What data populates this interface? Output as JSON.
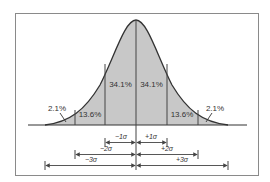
{
  "diagram": {
    "type": "normal-distribution",
    "colors": {
      "frame": "#8a8a8a",
      "fill": "#c8c8c8",
      "curve": "#333333",
      "lines": "#444444",
      "text": "#333333"
    },
    "regions": [
      {
        "id": "left-tail",
        "label": "2.1%"
      },
      {
        "id": "left-2sigma",
        "label": "13.6%"
      },
      {
        "id": "left-1sigma",
        "label": "34.1%"
      },
      {
        "id": "right-1sigma",
        "label": "34.1%"
      },
      {
        "id": "right-2sigma",
        "label": "13.6%"
      },
      {
        "id": "right-tail",
        "label": "2.1%"
      }
    ],
    "brackets": [
      {
        "id": "minus-1-sigma",
        "label": "−1σ"
      },
      {
        "id": "plus-1-sigma",
        "label": "+1σ"
      },
      {
        "id": "minus-2-sigma",
        "label": "−2σ"
      },
      {
        "id": "plus-2-sigma",
        "label": "+2σ"
      },
      {
        "id": "minus-3-sigma",
        "label": "−3σ"
      },
      {
        "id": "plus-3-sigma",
        "label": "+3σ"
      }
    ]
  }
}
